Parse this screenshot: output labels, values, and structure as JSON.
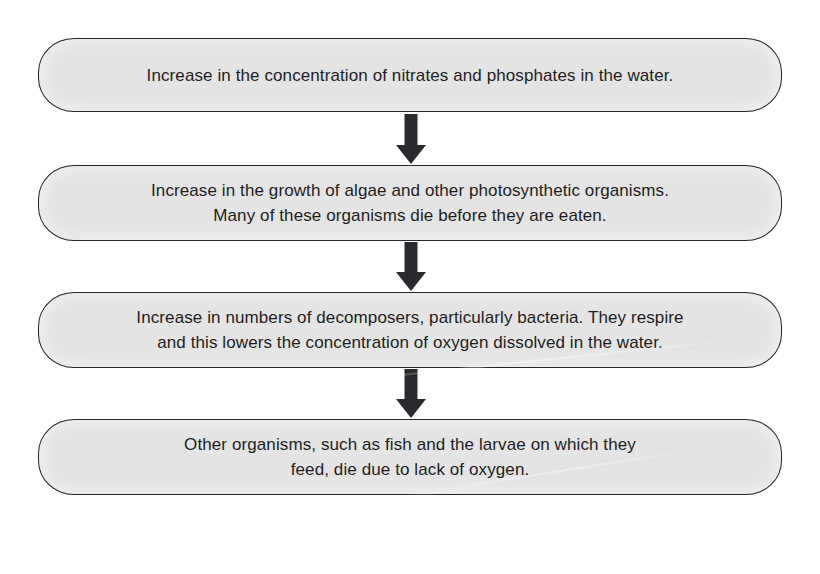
{
  "diagram": {
    "type": "flowchart",
    "orientation": "vertical",
    "background_color": "#ffffff",
    "box_fill_color": "#e4e4e4",
    "box_border_color": "#26262a",
    "text_color": "#1e1e22",
    "arrow_color": "#2a2a2e",
    "steps": [
      {
        "index": 1,
        "text": "Increase in the concentration of nitrates and phosphates in the water.",
        "lines": 1
      },
      {
        "index": 2,
        "text": "Increase in the growth of algae and other photosynthetic organisms.\nMany of these organisms die before they are eaten.",
        "lines": 2
      },
      {
        "index": 3,
        "text": "Increase in numbers of decomposers, particularly bacteria. They respire\nand this lowers the concentration of oxygen dissolved in the water.",
        "lines": 2
      },
      {
        "index": 4,
        "text": "Other organisms, such as fish and the larvae on which they\nfeed, die due to lack of oxygen.",
        "lines": 2
      }
    ],
    "connectors": [
      {
        "index": 1,
        "from_step": 1,
        "to_step": 2,
        "icon": "down-arrow-icon"
      },
      {
        "index": 2,
        "from_step": 2,
        "to_step": 3,
        "icon": "down-arrow-icon"
      },
      {
        "index": 3,
        "from_step": 3,
        "to_step": 4,
        "icon": "down-arrow-icon"
      }
    ]
  }
}
